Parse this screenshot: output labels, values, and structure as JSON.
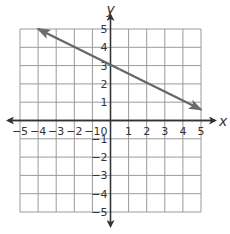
{
  "chart_data": {
    "type": "line",
    "title": "",
    "xlabel": "x",
    "ylabel": "y",
    "xlim": [
      -5,
      5
    ],
    "ylim": [
      -5,
      5
    ],
    "grid": true,
    "x_ticks": [
      "−5",
      "−4",
      "−3",
      "−2",
      "−1",
      "1",
      "2",
      "3",
      "4",
      "5"
    ],
    "y_ticks": [
      "5",
      "4",
      "3",
      "2",
      "1",
      "−1",
      "−2",
      "−3",
      "−4",
      "−5"
    ],
    "origin_label": "0",
    "series": [
      {
        "name": "line",
        "equation": "y = -4/9 x + 3",
        "x": [
          -4,
          5
        ],
        "y": [
          5,
          0.6
        ],
        "arrows": "both",
        "color": "#666666"
      }
    ]
  },
  "colors": {
    "grid": "#9a9a9a",
    "axis": "#333333",
    "line": "#6b6b6b"
  }
}
